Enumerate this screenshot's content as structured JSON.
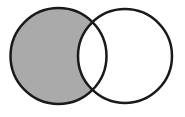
{
  "diagram": {
    "type": "venn",
    "sets": [
      {
        "name": "left-set",
        "cx": 58.5,
        "cy": 56,
        "r": 48
      },
      {
        "name": "right-set",
        "cx": 125,
        "cy": 56,
        "r": 47
      }
    ],
    "shaded_region": "left-only",
    "colors": {
      "shade": "#aaaaaa",
      "stroke": "#1a1a1a",
      "background": "#ffffff"
    }
  }
}
